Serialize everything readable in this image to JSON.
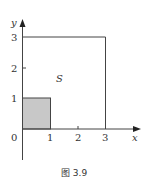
{
  "figure": {
    "caption": "图 3.9",
    "region_label": "S",
    "axes": {
      "x_label": "x",
      "y_label": "y",
      "origin_label": "0",
      "x_ticks": [
        "1",
        "2",
        "3"
      ],
      "y_ticks": [
        "1",
        "2",
        "3"
      ]
    },
    "shapes": [
      {
        "name": "outer-square",
        "x0": 0,
        "y0": 0,
        "x1": 3,
        "y1": 3,
        "fill": "none"
      },
      {
        "name": "unit-square",
        "x0": 0,
        "y0": 0,
        "x1": 1,
        "y1": 1,
        "fill": "#c8c8c8"
      }
    ]
  }
}
